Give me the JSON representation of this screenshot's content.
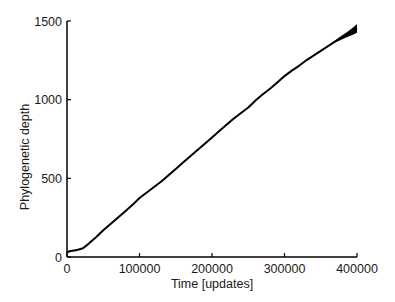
{
  "chart_data": {
    "type": "line",
    "title": "",
    "xlabel": "Time [updates]",
    "ylabel": "Phylogenetic depth",
    "xlim": [
      0,
      400000
    ],
    "ylim": [
      0,
      1500
    ],
    "x_ticks": [
      0,
      100000,
      200000,
      300000,
      400000
    ],
    "x_tick_labels": [
      "0",
      "100000",
      "200000",
      "300000",
      "400000"
    ],
    "y_ticks": [
      0,
      500,
      1000,
      1500
    ],
    "y_tick_labels": [
      "0",
      "500",
      "1000",
      "1500"
    ],
    "grid": false,
    "legend": null,
    "series": [
      {
        "name": "depth",
        "color": "#000000",
        "x": [
          0,
          5000,
          10000,
          15000,
          22000,
          30000,
          40000,
          50000,
          60000,
          70000,
          80000,
          90000,
          100000,
          110000,
          120000,
          130000,
          140000,
          150000,
          160000,
          170000,
          180000,
          190000,
          200000,
          210000,
          220000,
          230000,
          240000,
          250000,
          260000,
          270000,
          280000,
          290000,
          300000,
          310000,
          320000,
          330000,
          340000,
          350000,
          360000,
          370000,
          380000,
          390000,
          400000
        ],
        "values": [
          30,
          38,
          42,
          46,
          55,
          85,
          125,
          170,
          210,
          250,
          290,
          330,
          375,
          410,
          445,
          480,
          520,
          560,
          600,
          640,
          680,
          720,
          760,
          800,
          840,
          880,
          915,
          950,
          995,
          1035,
          1070,
          1110,
          1150,
          1185,
          1215,
          1250,
          1280,
          1310,
          1340,
          1370,
          1395,
          1425,
          1450
        ]
      }
    ],
    "spread_band": {
      "x": [
        365000,
        375000,
        385000,
        395000,
        400000
      ],
      "lower": [
        1355,
        1375,
        1395,
        1415,
        1425
      ],
      "upper": [
        1360,
        1395,
        1425,
        1460,
        1480
      ]
    }
  }
}
